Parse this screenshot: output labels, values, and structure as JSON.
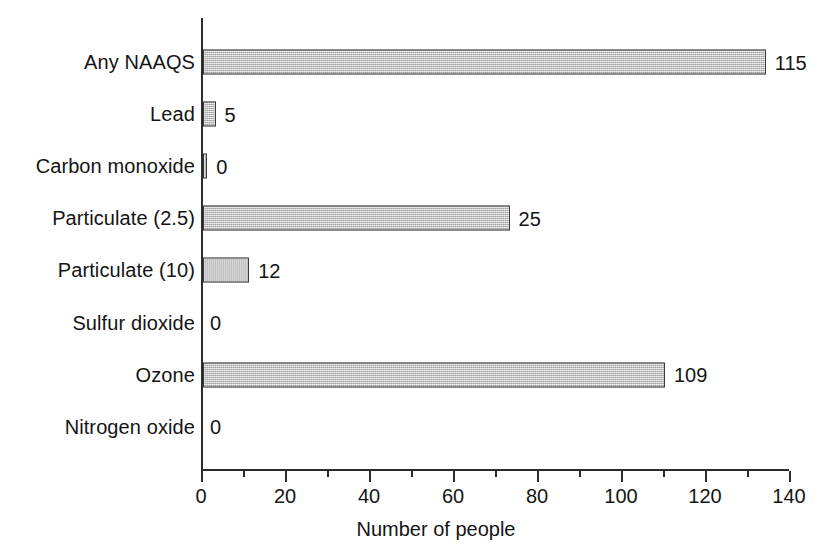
{
  "chart_data": {
    "type": "bar",
    "orientation": "horizontal",
    "title": "",
    "subtitle": "",
    "xlabel": "Number of people",
    "ylabel": "",
    "categories": [
      "Any NAAQS",
      "Lead",
      "Carbon monoxide",
      "Particulate (2.5)",
      "Particulate (10)",
      "Sulfur dioxide",
      "Ozone",
      "Nitrogen oxide"
    ],
    "values": [
      115,
      5,
      0,
      25,
      12,
      0,
      109,
      0
    ],
    "data_labels": [
      "115",
      "5",
      "0",
      "25",
      "12",
      "0",
      "109",
      "0"
    ],
    "drawn_bar_lengths": [
      134,
      3,
      1,
      73,
      11,
      0,
      110,
      0
    ],
    "xlim": [
      0,
      140
    ],
    "xticks": [
      0,
      20,
      40,
      60,
      80,
      100,
      120,
      140
    ],
    "xtick_labels": [
      "0",
      "20",
      "40",
      "60",
      "80",
      "100",
      "120",
      "140"
    ],
    "minor_xticks": [
      10,
      30,
      50,
      70,
      90,
      110,
      130
    ],
    "grid": false,
    "legend": null,
    "bar_fill_color": "#c9c9c9",
    "bar_border_color": "#3a3a3a",
    "text_color": "#141414",
    "background_color": "#ffffff"
  },
  "axis": {
    "x_title": "Number of people"
  }
}
